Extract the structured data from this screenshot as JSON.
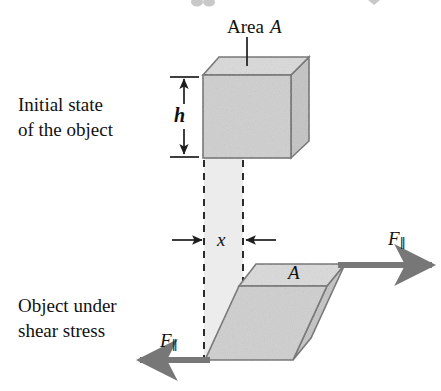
{
  "figure": {
    "captions": {
      "initial": "Initial state\nof the object",
      "sheared": "Object under\nshear stress"
    },
    "labels": {
      "area_word": "Area",
      "area_symbol": "A",
      "height_symbol": "h",
      "displacement_symbol": "x",
      "area_sheared_symbol": "A",
      "force_symbol": "F",
      "force_subscript": "∥"
    },
    "colors": {
      "top_face": "#d9d9d9",
      "front_face": "#cdcdcd",
      "side_face": "#c4c4c4",
      "outline": "#6e6e6e",
      "ghost_band": "#ececec",
      "arrow": "#757575",
      "dashed_line": "#2b2b2b",
      "text": "#111111",
      "background": "#ffffff"
    },
    "geometry": {
      "cube": {
        "front_top_left": [
          203,
          75
        ],
        "front_top_right": [
          291,
          75
        ],
        "front_bottom_left": [
          203,
          158
        ],
        "front_bottom_right": [
          291,
          158
        ],
        "back_top_left": [
          219,
          57
        ],
        "back_top_right": [
          309,
          57
        ],
        "back_bottom_right": [
          309,
          141
        ]
      },
      "sheared": {
        "front_top_left": [
          239,
          286
        ],
        "front_top_right": [
          327,
          286
        ],
        "front_bottom_left": [
          205,
          360
        ],
        "front_bottom_right": [
          293,
          360
        ],
        "back_top_left": [
          256,
          264
        ],
        "back_top_right": [
          345,
          264
        ],
        "back_bottom_right": [
          311,
          338
        ]
      },
      "dashed_lines_x": [
        204,
        243
      ],
      "height_arrow_x": 184,
      "height_arrow_top_y": 77,
      "height_arrow_bottom_y": 156
    }
  }
}
